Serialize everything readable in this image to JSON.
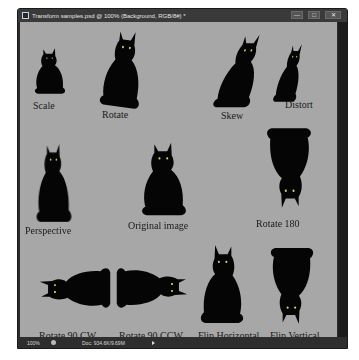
{
  "window": {
    "title": "Transform samples.psd @ 100% (Background, RGB/8#) *",
    "controls": {
      "minimize": "—",
      "maximize": "□",
      "close": "✕"
    }
  },
  "canvas": {
    "background": "#a7a7a7",
    "samples": [
      {
        "label": "Scale"
      },
      {
        "label": "Rotate"
      },
      {
        "label": "Skew"
      },
      {
        "label": "Distort"
      },
      {
        "label": "Perspective"
      },
      {
        "label": "Original image"
      },
      {
        "label": "Rotate 180"
      },
      {
        "label": "Rotate 90 CW"
      },
      {
        "label": "Rotate 90 CCW"
      },
      {
        "label": "Flip Horizontal"
      },
      {
        "label": "Flip Vertical"
      }
    ]
  },
  "statusbar": {
    "zoom": "100%",
    "doc": "Doc: 934.6K/9.69M"
  }
}
